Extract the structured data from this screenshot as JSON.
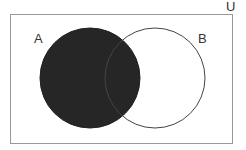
{
  "diagram": {
    "type": "venn",
    "universe_label": "U",
    "sets": [
      {
        "name": "A",
        "label": "A",
        "shaded": true
      },
      {
        "name": "B",
        "label": "B",
        "shaded": false
      }
    ],
    "shaded_region": "A",
    "colors": {
      "fill": "#262626",
      "outline": "#444444",
      "border": "#999999",
      "background": "#ffffff"
    }
  }
}
